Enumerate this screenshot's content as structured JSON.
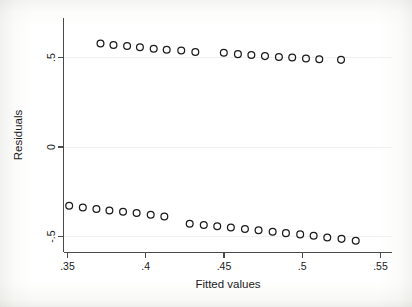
{
  "figure": {
    "background_color": "#ffffff",
    "frame_color": "#4a4a4a",
    "marker_color": "#1b1b1b",
    "gridline_color": "#f0f0ee"
  },
  "chart_data": {
    "type": "scatter",
    "title": "",
    "xlabel": "Fitted values",
    "ylabel": "Residuals",
    "xlim": [
      0.3385,
      0.5585
    ],
    "ylim": [
      -0.575,
      0.605
    ],
    "xticks": [
      0.35,
      0.4,
      0.45,
      0.5,
      0.55
    ],
    "xticklabels": [
      ".35",
      ".4",
      ".45",
      ".5",
      ".55"
    ],
    "yticks": [
      0.5,
      0,
      -0.5
    ],
    "yticklabels": [
      ".5",
      "0",
      "-.5"
    ],
    "grid": false,
    "legend": null,
    "marker": "open-circle",
    "series": [
      {
        "name": "positive-residuals",
        "x": [
          0.3714,
          0.3797,
          0.3884,
          0.3966,
          0.4054,
          0.4137,
          0.423,
          0.432,
          0.4502,
          0.4592,
          0.4678,
          0.4765,
          0.4854,
          0.4939,
          0.5027,
          0.5112,
          0.5251
        ],
        "y": [
          0.575,
          0.567,
          0.562,
          0.554,
          0.546,
          0.541,
          0.536,
          0.528,
          0.524,
          0.516,
          0.511,
          0.505,
          0.5,
          0.497,
          0.492,
          0.488,
          0.484
        ]
      },
      {
        "name": "negative-residuals",
        "x": [
          0.3514,
          0.3601,
          0.3688,
          0.3771,
          0.3858,
          0.3945,
          0.4035,
          0.4122,
          0.4284,
          0.4374,
          0.446,
          0.4547,
          0.4637,
          0.4724,
          0.4814,
          0.4899,
          0.499,
          0.5076,
          0.5163,
          0.5254,
          0.5345
        ],
        "y": [
          -0.331,
          -0.341,
          -0.349,
          -0.358,
          -0.364,
          -0.372,
          -0.381,
          -0.391,
          -0.431,
          -0.438,
          -0.446,
          -0.453,
          -0.461,
          -0.468,
          -0.476,
          -0.484,
          -0.491,
          -0.499,
          -0.508,
          -0.516,
          -0.526
        ]
      }
    ]
  }
}
